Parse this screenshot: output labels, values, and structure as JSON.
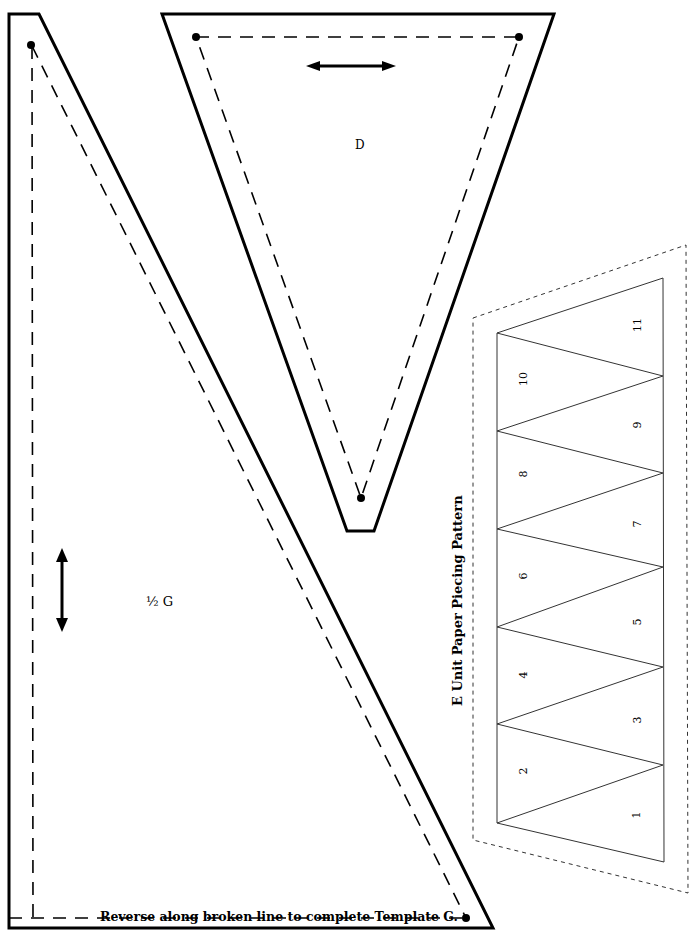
{
  "template_g": {
    "label": "½ G",
    "note": "Reverse along broken line to complete Template G.",
    "grainline": "vertical"
  },
  "template_d": {
    "label": "D",
    "grainline": "horizontal"
  },
  "e_unit": {
    "title": "E Unit Paper Piecing Pattern",
    "pieces": [
      {
        "n": "1",
        "x": 636,
        "y": 815
      },
      {
        "n": "2",
        "x": 523,
        "y": 771
      },
      {
        "n": "3",
        "x": 637,
        "y": 720
      },
      {
        "n": "4",
        "x": 523,
        "y": 675
      },
      {
        "n": "5",
        "x": 637,
        "y": 622
      },
      {
        "n": "6",
        "x": 523,
        "y": 576
      },
      {
        "n": "7",
        "x": 637,
        "y": 524
      },
      {
        "n": "8",
        "x": 523,
        "y": 474
      },
      {
        "n": "9",
        "x": 637,
        "y": 425
      },
      {
        "n": "10",
        "x": 523,
        "y": 379
      },
      {
        "n": "11",
        "x": 637,
        "y": 325
      }
    ]
  },
  "colors": {
    "ink": "#000000",
    "pattern_line": "#333333",
    "paper": "#ffffff"
  }
}
